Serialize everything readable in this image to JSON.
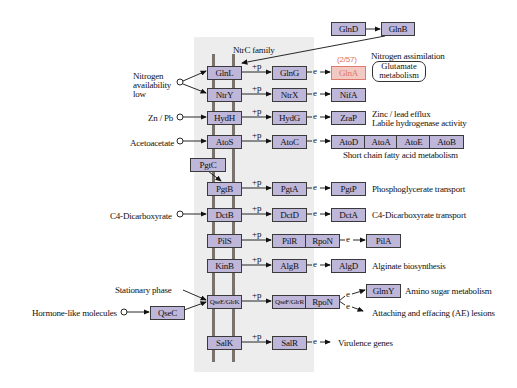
{
  "title": "NtrC family",
  "highlight_color": "#e07a6c",
  "node_color": "#bfb7d9",
  "boxes": [
    {
      "id": "GlnD",
      "x": 331,
      "y": 22,
      "w": 33
    },
    {
      "id": "GlnB",
      "x": 381,
      "y": 22,
      "w": 32
    },
    {
      "id": "GlnL",
      "x": 207,
      "y": 66,
      "w": 33
    },
    {
      "id": "GlnG",
      "x": 272,
      "y": 66,
      "w": 33
    },
    {
      "id": "GlnA",
      "x": 331,
      "y": 66,
      "w": 33,
      "highlight": true,
      "count": "(2/57)"
    },
    {
      "id": "NtrY",
      "x": 207,
      "y": 88,
      "w": 33
    },
    {
      "id": "NtrX",
      "x": 272,
      "y": 88,
      "w": 33
    },
    {
      "id": "NifA",
      "x": 331,
      "y": 88,
      "w": 33
    },
    {
      "id": "HydH",
      "x": 207,
      "y": 111,
      "w": 33
    },
    {
      "id": "HydG",
      "x": 272,
      "y": 111,
      "w": 33
    },
    {
      "id": "ZraP",
      "x": 331,
      "y": 111,
      "w": 33
    },
    {
      "id": "AtoS",
      "x": 207,
      "y": 135,
      "w": 33
    },
    {
      "id": "AtoC",
      "x": 272,
      "y": 135,
      "w": 33
    },
    {
      "id": "AtoD",
      "x": 331,
      "y": 135,
      "w": 33
    },
    {
      "id": "AtoA",
      "x": 364,
      "y": 135,
      "w": 32
    },
    {
      "id": "AtoE",
      "x": 396,
      "y": 135,
      "w": 33
    },
    {
      "id": "AtoB",
      "x": 429,
      "y": 135,
      "w": 33
    },
    {
      "id": "PgtC",
      "x": 190,
      "y": 158,
      "w": 34
    },
    {
      "id": "PgtB",
      "x": 207,
      "y": 182,
      "w": 33
    },
    {
      "id": "PgtA",
      "x": 272,
      "y": 182,
      "w": 33
    },
    {
      "id": "PgtP",
      "x": 331,
      "y": 182,
      "w": 33
    },
    {
      "id": "DctB",
      "x": 207,
      "y": 208,
      "w": 33
    },
    {
      "id": "DctD",
      "x": 272,
      "y": 208,
      "w": 33
    },
    {
      "id": "DctA",
      "x": 331,
      "y": 208,
      "w": 33
    },
    {
      "id": "PilS",
      "x": 207,
      "y": 234,
      "w": 33
    },
    {
      "id": "PilR",
      "x": 272,
      "y": 234,
      "w": 33
    },
    {
      "id": "RpoN",
      "x": 305,
      "y": 234,
      "w": 33
    },
    {
      "id": "PilA",
      "x": 366,
      "y": 234,
      "w": 33
    },
    {
      "id": "KinB",
      "x": 207,
      "y": 259,
      "w": 33
    },
    {
      "id": "AlgB",
      "x": 272,
      "y": 259,
      "w": 33
    },
    {
      "id": "AlgD",
      "x": 331,
      "y": 259,
      "w": 33
    },
    {
      "id": "GlmY",
      "x": 366,
      "y": 284,
      "w": 33
    },
    {
      "id": "QseE/GlrK",
      "x": 207,
      "y": 295,
      "w": 33
    },
    {
      "id": "QseF/GlrR",
      "x": 272,
      "y": 295,
      "w": 33
    },
    {
      "id": "RpoN",
      "x": 305,
      "y": 295,
      "w": 33
    },
    {
      "id": "QseC",
      "x": 150,
      "y": 306,
      "w": 33
    },
    {
      "id": "SalK",
      "x": 207,
      "y": 336,
      "w": 33
    },
    {
      "id": "SalR",
      "x": 272,
      "y": 336,
      "w": 33
    }
  ],
  "labels": {
    "family": "NtrC family",
    "nitrogen_low": [
      "Nitrogen",
      "availability",
      "low"
    ],
    "zn_pb": "Zn / Pb",
    "acetoacetate": "Acetoacetate",
    "c4_left": "C4-Dicarboxyrate",
    "stationary": "Stationary phase",
    "hormone": "Hormone-like molecules",
    "nitrogen_assim": "Nitrogen assimilation",
    "glutamate_map": [
      "Glutamate",
      "metabolism"
    ],
    "zinc": [
      "Zinc / lead efflux",
      "Labile hydrogenase activity"
    ],
    "short_chain": "Short chain fatty acid metabolism",
    "phosphoglycerate": "Phosphoglycerate transport",
    "c4_right": "C4-Dicarboxyrate transport",
    "alginate": "Alginate biosynthesis",
    "amino_sugar": "Amino sugar metabolism",
    "ae_lesions": "Attaching and effacing (AE) lesions",
    "virulence": "Virulence genes",
    "plus_p": "+p",
    "e": "e"
  }
}
